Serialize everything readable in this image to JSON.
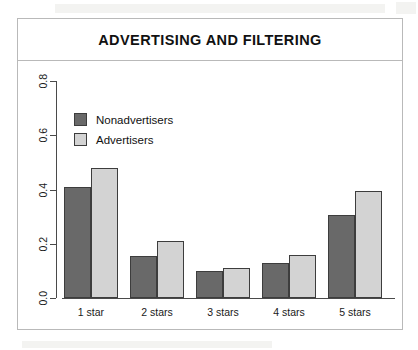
{
  "figure": {
    "title": "ADVERTISING AND FILTERING",
    "frame_color": "#b9b9b9",
    "background": "#ffffff"
  },
  "legend": {
    "position": "top-left",
    "entries": [
      {
        "label": "Nonadvertisers",
        "color": "#696969"
      },
      {
        "label": "Advertisers",
        "color": "#d3d3d3"
      }
    ]
  },
  "axes": {
    "y_ticks": [
      "0.0",
      "0.2",
      "0.4",
      "0.6",
      "0.8"
    ],
    "x_ticks": [
      "1 star",
      "2 stars",
      "3 stars",
      "4 stars",
      "5 stars"
    ]
  },
  "chart_data": {
    "type": "bar",
    "title": "ADVERTISING AND FILTERING",
    "xlabel": "",
    "ylabel": "",
    "ylim": [
      0,
      0.8
    ],
    "grid": false,
    "legend_position": "top-left",
    "categories": [
      "1 star",
      "2 stars",
      "3 stars",
      "4 stars",
      "5 stars"
    ],
    "series": [
      {
        "name": "Nonadvertisers",
        "color": "#696969",
        "values": [
          0.41,
          0.155,
          0.1,
          0.13,
          0.305
        ]
      },
      {
        "name": "Advertisers",
        "color": "#d3d3d3",
        "values": [
          0.48,
          0.21,
          0.11,
          0.16,
          0.395
        ]
      }
    ]
  }
}
